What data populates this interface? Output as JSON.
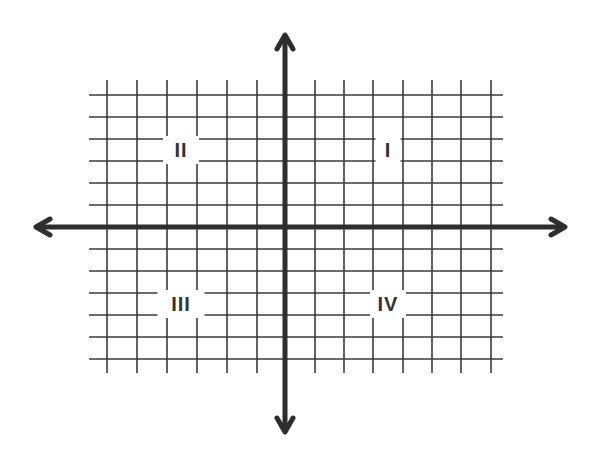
{
  "diagram": {
    "colors": {
      "background": "#ffffff",
      "grid": "#3a3a3a",
      "axis": "#2e2e2e",
      "label": "#333333"
    },
    "grid": {
      "vertical_x": [
        107,
        137,
        167,
        197,
        227,
        257,
        315,
        344,
        373,
        403,
        432,
        461,
        491
      ],
      "vertical_y_range": [
        80,
        373
      ],
      "horizontal_y": [
        95,
        117,
        139,
        161,
        183,
        205,
        249,
        271,
        293,
        315,
        337,
        359
      ],
      "horizontal_x_range": [
        89,
        503
      ]
    },
    "axes": {
      "x_axis": {
        "y": 227,
        "from_x": 36,
        "to_x": 565,
        "arrows": "both"
      },
      "y_axis": {
        "x": 285,
        "from_y": 35,
        "to_y": 432,
        "arrows": "both"
      }
    },
    "quadrants": [
      {
        "id": "I",
        "label": "I",
        "x": 388,
        "y": 150
      },
      {
        "id": "II",
        "label": "II",
        "x": 181,
        "y": 150
      },
      {
        "id": "III",
        "label": "III",
        "x": 181,
        "y": 304
      },
      {
        "id": "IV",
        "label": "IV",
        "x": 388,
        "y": 304
      }
    ]
  }
}
